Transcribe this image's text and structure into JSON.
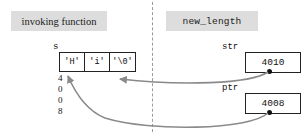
{
  "diagram": {
    "panels": {
      "left_label": "invoking function",
      "right_label": "new_length"
    },
    "divider": {
      "style": "dashed",
      "color": "#9a9a9a"
    }
  },
  "left_panel": {
    "variable_name": "s",
    "array_cells": [
      "'H'",
      "'i'",
      "'\\0'"
    ],
    "address_digits": [
      "4",
      "0",
      "0",
      "8"
    ],
    "address_value": "4008"
  },
  "right_panel": {
    "pointers": [
      {
        "name": "str",
        "value": "4010"
      },
      {
        "name": "ptr",
        "value": "4008"
      }
    ]
  },
  "arrows": [
    {
      "from": "str",
      "to": "array-cell-3",
      "label": ""
    },
    {
      "from": "ptr",
      "to": "array-start",
      "label": ""
    }
  ],
  "colors": {
    "panel_bg": "#dddddd",
    "stroke": "#222222",
    "arrow": "#8a8a8a",
    "background": "#ffffff"
  }
}
